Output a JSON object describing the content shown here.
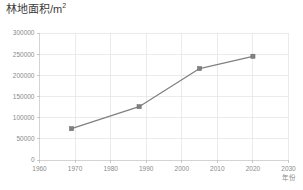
{
  "chart_data": {
    "type": "line",
    "title": "林地面积/m",
    "title_superscript": "2",
    "title_full": "林地面积/m²",
    "xlabel": "年份",
    "ylabel": "",
    "xlim": [
      1960,
      2030
    ],
    "ylim": [
      0,
      300000
    ],
    "grid": true,
    "legend": false,
    "legend_position": "none",
    "x_ticks": [
      1960,
      1970,
      1980,
      1990,
      2000,
      2010,
      2020,
      2030
    ],
    "y_ticks": [
      0,
      50000,
      100000,
      150000,
      200000,
      250000,
      300000
    ],
    "x_tick_labels": [
      "1960",
      "1970",
      "1980",
      "1990",
      "2000",
      "2010",
      "2020",
      "2030"
    ],
    "y_tick_labels": [
      "0",
      "50000",
      "100000",
      "150000",
      "200000",
      "250000",
      "300000"
    ],
    "series": [
      {
        "name": "林地面积",
        "x": [
          1969,
          1988,
          2005,
          2020
        ],
        "values": [
          74000,
          126000,
          216000,
          245000
        ],
        "color": "#808080",
        "marker": "square"
      }
    ]
  },
  "style": {
    "line_color": "#808080",
    "marker_color": "#808080",
    "grid_color": "#e2e2e2",
    "axis_color": "#c9c9c9",
    "tick_label_color": "#8a8a8a",
    "title_color": "#3b3b3b",
    "background": "#ffffff"
  }
}
